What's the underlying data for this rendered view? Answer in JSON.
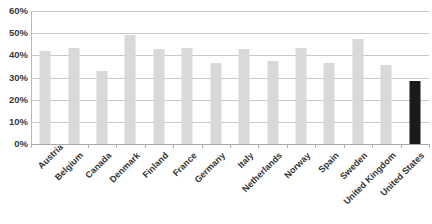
{
  "chart_data": {
    "type": "bar",
    "title": "",
    "subtitle": "",
    "xlabel": "",
    "ylabel": "",
    "ylim": [
      0,
      0.6
    ],
    "y_ticks": [
      "0%",
      "10%",
      "20%",
      "30%",
      "40%",
      "50%",
      "60%"
    ],
    "y_tick_values": [
      0,
      10,
      20,
      30,
      40,
      50,
      60
    ],
    "grid": true,
    "legend": "none",
    "value_unit": "percent",
    "categories": [
      "Austria",
      "Belgium",
      "Canada",
      "Denmark",
      "Finland",
      "France",
      "Germany",
      "Italy",
      "Netherlands",
      "Norway",
      "Spain",
      "Sweden",
      "United Kingdom",
      "United States"
    ],
    "values": [
      42.0,
      43.5,
      33.0,
      49.0,
      43.0,
      43.5,
      36.5,
      43.0,
      37.5,
      43.5,
      36.5,
      47.5,
      35.5,
      28.5
    ],
    "colors": {
      "bar": "#d9d9d9",
      "bar_highlight": "#1a1a1a",
      "gridline": "#c8c8c8",
      "axis": "#b7b7b7",
      "text": "#333333",
      "background": "#ffffff"
    },
    "highlighted_category": "United States"
  }
}
